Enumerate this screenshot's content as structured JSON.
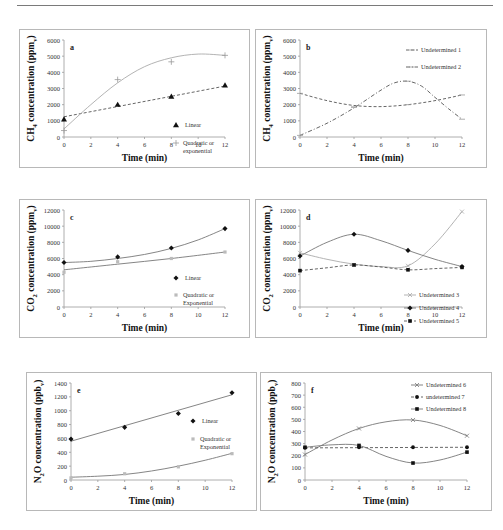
{
  "figure": {
    "panels": [
      "a",
      "b",
      "c",
      "d",
      "e",
      "f"
    ]
  },
  "chart_data": [
    {
      "panel": "a",
      "type": "scatter",
      "title": "",
      "panel_label": "a",
      "xlabel": "Time (min)",
      "ylabel": "CH4 concentration (ppmv)",
      "ylabel_parts": {
        "pre": "CH",
        "sub1": "4",
        "mid": " concentration (ppm",
        "sub2": "v",
        "post": ")"
      },
      "xlim": [
        0,
        12
      ],
      "ylim": [
        0,
        6000
      ],
      "xticks": [
        0,
        2,
        4,
        6,
        8,
        10,
        12
      ],
      "yticks": [
        0,
        1000,
        2000,
        3000,
        4000,
        5000,
        6000
      ],
      "grid": false,
      "legend_position": "right",
      "x": [
        0,
        4,
        8,
        12
      ],
      "series": [
        {
          "name": "Linear",
          "values": [
            1100,
            2000,
            2500,
            3200
          ],
          "marker": "triangle",
          "line": "dashed",
          "fit": [
            [
              0,
              1250
            ],
            [
              12,
              3150
            ]
          ]
        },
        {
          "name": "Quadratic or exponential",
          "values": [
            400,
            3550,
            4650,
            5050
          ],
          "marker": "plus",
          "line": "solid-light",
          "fit": [
            [
              0,
              500
            ],
            [
              2,
              2000
            ],
            [
              4,
              3350
            ],
            [
              6,
              4350
            ],
            [
              8,
              4900
            ],
            [
              10,
              5130
            ],
            [
              12,
              5050
            ]
          ]
        }
      ]
    },
    {
      "panel": "b",
      "type": "scatter",
      "title": "",
      "panel_label": "b",
      "xlabel": "Time (min)",
      "ylabel": "CH4 concentration (ppmv)",
      "ylabel_parts": {
        "pre": "CH",
        "sub1": "4",
        "mid": " concentration (ppm",
        "sub2": "v",
        "post": ")"
      },
      "xlim": [
        0,
        12
      ],
      "ylim": [
        0,
        6000
      ],
      "xticks": [
        0,
        2,
        4,
        6,
        8,
        10,
        12
      ],
      "yticks": [
        0,
        1000,
        2000,
        3000,
        4000,
        5000,
        6000
      ],
      "grid": false,
      "legend_position": "upper right",
      "x": [
        0,
        4,
        8,
        12
      ],
      "series": [
        {
          "name": "Undetermined 1",
          "values": [
            2700,
            1850,
            2000,
            2600
          ],
          "marker": "dash",
          "line": "dashed",
          "fit": [
            [
              0,
              2700
            ],
            [
              2,
              2250
            ],
            [
              4,
              1950
            ],
            [
              6,
              1880
            ],
            [
              8,
              2000
            ],
            [
              10,
              2250
            ],
            [
              12,
              2600
            ]
          ]
        },
        {
          "name": "Undetermined 2",
          "values": [
            100,
            1850,
            3450,
            1100
          ],
          "marker": "dash",
          "line": "dashdot",
          "fit": [
            [
              0,
              100
            ],
            [
              2,
              850
            ],
            [
              4,
              1800
            ],
            [
              6,
              2900
            ],
            [
              7,
              3350
            ],
            [
              8,
              3450
            ],
            [
              9,
              3150
            ],
            [
              10,
              2450
            ],
            [
              11,
              1750
            ],
            [
              12,
              1100
            ]
          ]
        }
      ]
    },
    {
      "panel": "c",
      "type": "scatter",
      "title": "",
      "panel_label": "c",
      "xlabel": "Time (min)",
      "ylabel": "CO2 concentration (ppmv)",
      "ylabel_parts": {
        "pre": "CO",
        "sub1": "2",
        "mid": " concentration (ppm",
        "sub2": "v",
        "post": ")"
      },
      "xlim": [
        0,
        12
      ],
      "ylim": [
        0,
        12000
      ],
      "xticks": [
        0,
        2,
        4,
        6,
        8,
        10,
        12
      ],
      "yticks": [
        0,
        2000,
        4000,
        6000,
        8000,
        10000,
        12000
      ],
      "grid": false,
      "legend_position": "right",
      "x": [
        0,
        4,
        8,
        12
      ],
      "series": [
        {
          "name": "Linear",
          "values": [
            5500,
            6200,
            7300,
            9700
          ],
          "marker": "diamond",
          "line": "solid",
          "fit": [
            [
              0,
              5500
            ],
            [
              2,
              5650
            ],
            [
              4,
              6000
            ],
            [
              6,
              6500
            ],
            [
              8,
              7250
            ],
            [
              10,
              8300
            ],
            [
              12,
              9700
            ]
          ]
        },
        {
          "name": "Quadratic or Exponential",
          "values": [
            4300,
            5600,
            6000,
            6800
          ],
          "marker": "square-light",
          "line": "solid",
          "fit": [
            [
              0,
              4600
            ],
            [
              4,
              5300
            ],
            [
              8,
              6000
            ],
            [
              12,
              6800
            ]
          ]
        }
      ]
    },
    {
      "panel": "d",
      "type": "scatter",
      "title": "",
      "panel_label": "d",
      "xlabel": "Time (min)",
      "ylabel": "CO2 concentration (ppmv)",
      "ylabel_parts": {
        "pre": "CO",
        "sub1": "2",
        "mid": " concentration (ppm",
        "sub2": "v",
        "post": ")"
      },
      "xlim": [
        0,
        12
      ],
      "ylim": [
        0,
        12000
      ],
      "xticks": [
        0,
        2,
        4,
        6,
        8,
        10,
        12
      ],
      "yticks": [
        0,
        2000,
        4000,
        6000,
        8000,
        10000,
        12000
      ],
      "grid": false,
      "legend_position": "lower right",
      "x": [
        0,
        4,
        8,
        12
      ],
      "series": [
        {
          "name": "Undetermined 3",
          "values": [
            6700,
            5200,
            5100,
            11800
          ],
          "marker": "x-light",
          "line": "solid-light",
          "fit": [
            [
              0,
              6700
            ],
            [
              2,
              5900
            ],
            [
              4,
              5300
            ],
            [
              6,
              5000
            ],
            [
              8,
              5100
            ],
            [
              10,
              7800
            ],
            [
              12,
              11800
            ]
          ]
        },
        {
          "name": "Undetermined 4",
          "values": [
            6300,
            9000,
            7000,
            5000
          ],
          "marker": "diamond",
          "line": "solid",
          "fit": [
            [
              0,
              6300
            ],
            [
              2,
              8000
            ],
            [
              4,
              9000
            ],
            [
              6,
              8200
            ],
            [
              8,
              7000
            ],
            [
              10,
              5900
            ],
            [
              12,
              5000
            ]
          ]
        },
        {
          "name": "Undetermined 5",
          "values": [
            4500,
            5200,
            4600,
            4900
          ],
          "marker": "square",
          "line": "dashed",
          "fit": [
            [
              0,
              4500
            ],
            [
              2,
              4850
            ],
            [
              4,
              5200
            ],
            [
              6,
              4950
            ],
            [
              8,
              4600
            ],
            [
              10,
              4750
            ],
            [
              12,
              4900
            ]
          ]
        }
      ]
    },
    {
      "panel": "e",
      "type": "scatter",
      "title": "",
      "panel_label": "e",
      "xlabel": "Time (min)",
      "ylabel": "N2O concentration (ppbv)",
      "ylabel_parts": {
        "pre": "N",
        "sub1": "2",
        "mid": "O concentration (ppb",
        "sub2": "v",
        "post": ")"
      },
      "xlim": [
        0,
        12
      ],
      "ylim": [
        0,
        1400
      ],
      "xticks": [
        0,
        2,
        4,
        6,
        8,
        10,
        12
      ],
      "yticks": [
        0,
        200,
        400,
        600,
        800,
        1000,
        1200,
        1400
      ],
      "grid": false,
      "legend_position": "right",
      "x": [
        0,
        4,
        8,
        12
      ],
      "series": [
        {
          "name": "Linear",
          "values": [
            590,
            760,
            960,
            1260
          ],
          "marker": "diamond",
          "line": "solid",
          "fit": [
            [
              0,
              560
            ],
            [
              12,
              1230
            ]
          ]
        },
        {
          "name": "Quadratic or Exponential",
          "values": [
            30,
            90,
            190,
            380
          ],
          "marker": "square-light",
          "line": "solid",
          "fit": [
            [
              0,
              40
            ],
            [
              2,
              55
            ],
            [
              4,
              80
            ],
            [
              6,
              130
            ],
            [
              8,
              200
            ],
            [
              10,
              285
            ],
            [
              12,
              385
            ]
          ]
        }
      ]
    },
    {
      "panel": "f",
      "type": "scatter",
      "title": "",
      "panel_label": "f",
      "xlabel": "Time (min)",
      "ylabel": "N2O concentration (ppbv)",
      "ylabel_parts": {
        "pre": "N",
        "sub1": "2",
        "mid": "O concentration (ppb",
        "sub2": "v",
        "post": ")"
      },
      "xlim": [
        0,
        12
      ],
      "ylim": [
        0,
        800
      ],
      "xticks": [
        0,
        2,
        4,
        6,
        8,
        10,
        12
      ],
      "yticks": [
        0,
        100,
        200,
        300,
        400,
        500,
        600,
        700,
        800
      ],
      "grid": false,
      "legend_position": "upper right",
      "x": [
        0,
        4,
        8,
        12
      ],
      "series": [
        {
          "name": "Undetermined 6",
          "values": [
            210,
            425,
            495,
            365
          ],
          "marker": "x",
          "line": "solid",
          "fit": [
            [
              0,
              210
            ],
            [
              2,
              330
            ],
            [
              4,
              425
            ],
            [
              6,
              480
            ],
            [
              8,
              495
            ],
            [
              10,
              450
            ],
            [
              12,
              365
            ]
          ]
        },
        {
          "name": "undetermined 7",
          "values": [
            265,
            270,
            270,
            270
          ],
          "marker": "dot",
          "line": "dashed",
          "fit": [
            [
              0,
              265
            ],
            [
              12,
              270
            ]
          ]
        },
        {
          "name": "Undetermined 8",
          "values": [
            270,
            285,
            140,
            230
          ],
          "marker": "square",
          "line": "solid",
          "fit": [
            [
              0,
              270
            ],
            [
              2,
              290
            ],
            [
              4,
              285
            ],
            [
              6,
              195
            ],
            [
              8,
              140
            ],
            [
              10,
              165
            ],
            [
              12,
              230
            ]
          ]
        }
      ]
    }
  ]
}
